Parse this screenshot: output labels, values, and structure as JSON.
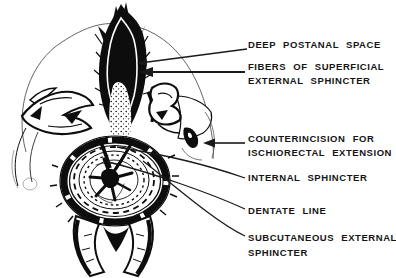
{
  "figure": {
    "colors": {
      "ink": "#0d0d0d",
      "background": "#ffffff",
      "faint_line": "#555555"
    },
    "labels": {
      "deep_postanal_space": "DEEP POSTANAL SPACE",
      "fibers_superficial_1": "FIBERS OF SUPERFICIAL",
      "fibers_superficial_2": "EXTERNAL SPHINCTER",
      "counterincision_1": "COUNTERINCISION FOR",
      "counterincision_2": "ISCHIORECTAL EXTENSION",
      "internal_sphincter": "INTERNAL SPHINCTER",
      "dentate_line": "DENTATE LINE",
      "subcutaneous_external_1": "SUBCUTANEOUS EXTERNAL",
      "subcutaneous_external_2": "SPHINCTER"
    }
  }
}
